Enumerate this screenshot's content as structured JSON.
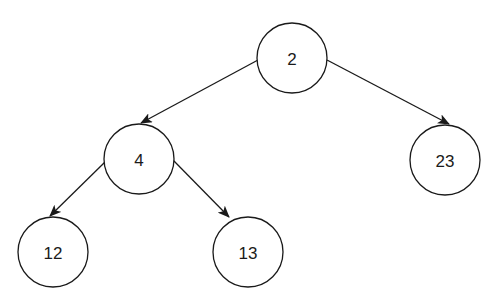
{
  "diagram": {
    "type": "binary-tree",
    "style": {
      "stroke_color": "#1a1a1a",
      "fill_color": "#ffffff",
      "background": "#ffffff"
    },
    "nodes": [
      {
        "id": "n2",
        "label": "2",
        "cx": 292,
        "cy": 58,
        "r": 35
      },
      {
        "id": "n4",
        "label": "4",
        "cx": 139,
        "cy": 159,
        "r": 35
      },
      {
        "id": "n23",
        "label": "23",
        "cx": 445,
        "cy": 160,
        "r": 35
      },
      {
        "id": "n12",
        "label": "12",
        "cx": 53,
        "cy": 252,
        "r": 35
      },
      {
        "id": "n13",
        "label": "13",
        "cx": 248,
        "cy": 252,
        "r": 35
      }
    ],
    "edges": [
      {
        "from": "2",
        "to": "4",
        "x1": 258,
        "y1": 60,
        "x2": 141,
        "y2": 123
      },
      {
        "from": "2",
        "to": "23",
        "x1": 327,
        "y1": 60,
        "x2": 449,
        "y2": 124
      },
      {
        "from": "4",
        "to": "12",
        "x1": 105,
        "y1": 162,
        "x2": 50,
        "y2": 216
      },
      {
        "from": "4",
        "to": "13",
        "x1": 173,
        "y1": 160,
        "x2": 229,
        "y2": 217
      }
    ]
  }
}
